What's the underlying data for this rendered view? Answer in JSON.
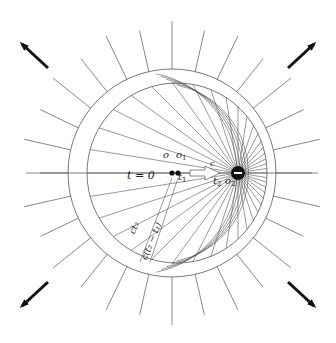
{
  "diagram": {
    "charge_symbol": "−",
    "labels": {
      "t0": "t = 0",
      "o": "o",
      "o1": "o",
      "o1_sub": "1",
      "t1": "t",
      "t1_sub": "1",
      "c": "c",
      "t2": "t",
      "t2_sub": "2",
      "o2": "o",
      "o2_sub": "2",
      "ct2": "ct₂",
      "ct2t1": "c(t₂ − t₁)"
    },
    "corner_arrows": [
      "up-left",
      "up-right",
      "down-left",
      "down-right"
    ],
    "colors": {
      "line": "#555555",
      "arrow": "#111111",
      "background": "#ffffff"
    }
  }
}
